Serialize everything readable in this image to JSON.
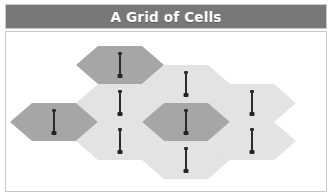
{
  "window": {
    "title": "A Grid of Cells"
  },
  "colors": {
    "title_bar": "#787878",
    "title_text": "#ffffff",
    "frame_border": "#c9c9c9",
    "canvas_background": "#ffffff",
    "cell_dark": "#a6a6a6",
    "cell_light": "#e3e3e1",
    "marker": "#2b2b2b"
  },
  "diagram": {
    "type": "hexagonal-grid",
    "cell_count": 9,
    "marker_icon": "nail-pin-icon",
    "marker_label": "",
    "cells": [
      {
        "id": "cell-1",
        "shade": "dark",
        "row": 1,
        "column": 2,
        "x": 70,
        "y": 14,
        "width": 88,
        "height": 38,
        "has_marker": true
      },
      {
        "id": "cell-2",
        "shade": "light",
        "row": 1,
        "column": 3,
        "x": 136,
        "y": 33,
        "width": 88,
        "height": 38,
        "has_marker": true
      },
      {
        "id": "cell-3",
        "shade": "light",
        "row": 1,
        "column": 4,
        "x": 202,
        "y": 52,
        "width": 88,
        "height": 38,
        "has_marker": true
      },
      {
        "id": "cell-4",
        "shade": "light",
        "row": 2,
        "column": 2,
        "x": 70,
        "y": 52,
        "width": 88,
        "height": 38,
        "has_marker": true
      },
      {
        "id": "cell-5",
        "shade": "dark",
        "row": 2,
        "column": 1,
        "x": 4,
        "y": 71,
        "width": 88,
        "height": 38,
        "has_marker": true
      },
      {
        "id": "cell-6",
        "shade": "dark",
        "row": 2,
        "column": 3,
        "x": 136,
        "y": 71,
        "width": 88,
        "height": 38,
        "has_marker": true
      },
      {
        "id": "cell-7",
        "shade": "light",
        "row": 3,
        "column": 2,
        "x": 70,
        "y": 90,
        "width": 88,
        "height": 38,
        "has_marker": true
      },
      {
        "id": "cell-8",
        "shade": "light",
        "row": 3,
        "column": 4,
        "x": 202,
        "y": 90,
        "width": 88,
        "height": 38,
        "has_marker": true
      },
      {
        "id": "cell-9",
        "shade": "light",
        "row": 3,
        "column": 3,
        "x": 136,
        "y": 109,
        "width": 88,
        "height": 38,
        "has_marker": true
      }
    ]
  }
}
